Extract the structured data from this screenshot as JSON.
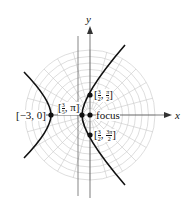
{
  "axes": {
    "x_label": "x",
    "y_label": "y"
  },
  "curve": {
    "type": "hyperbola",
    "description": "polar conic with focus at origin"
  },
  "points": [
    {
      "name": "left-vertex",
      "label": "[−3, 0]"
    },
    {
      "name": "right-vertex",
      "label_num": "3",
      "label_den": "5",
      "label_rest": ", π]",
      "label_open": "["
    },
    {
      "name": "top-point",
      "label_num": "3",
      "label_den": "2",
      "label_num2": "π",
      "label_den2": "2"
    },
    {
      "name": "bottom-point",
      "label_num": "3",
      "label_den": "2",
      "label_num2": "3π",
      "label_den2": "2"
    },
    {
      "name": "focus",
      "label": "focus"
    }
  ],
  "colors": {
    "grid": "#c8c8c8",
    "curve": "#111111",
    "axis": "#333333"
  }
}
